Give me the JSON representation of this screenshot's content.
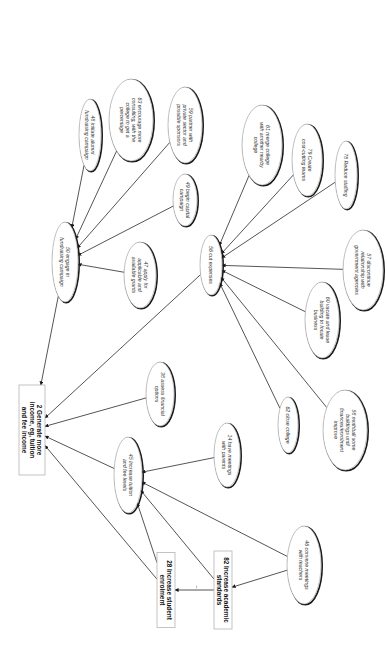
{
  "diagram": {
    "orientation": "rotated-90-clockwise",
    "goal_nodes": [
      {
        "id": "2",
        "lines": [
          "2 Generate more",
          "income, eg, tuition",
          "and fee income"
        ],
        "cx": 32,
        "cy": 430,
        "w": 26,
        "h": 90
      },
      {
        "id": "28",
        "lines": [
          "28 Increase student",
          "enrolment"
        ],
        "cx": 166,
        "cy": 590,
        "w": 18,
        "h": 75
      },
      {
        "id": "82",
        "lines": [
          "82 Increase academic",
          "standards"
        ],
        "cx": 223,
        "cy": 590,
        "w": 18,
        "h": 78
      }
    ],
    "option_nodes": [
      {
        "id": "48",
        "lines": [
          "48 initiate alumni",
          "fundraising campaign"
        ],
        "cx": 90,
        "cy": 135,
        "rx": 11,
        "ry": 36
      },
      {
        "id": "63",
        "lines": [
          "63 encourage more",
          "consulting, with the",
          "college to get a",
          "percentage"
        ],
        "cx": 131,
        "cy": 120,
        "rx": 22,
        "ry": 41
      },
      {
        "id": "59",
        "lines": [
          "59 partner with",
          "private sector and",
          "possible sponsors"
        ],
        "cx": 185,
        "cy": 125,
        "rx": 17,
        "ry": 38
      },
      {
        "id": "49",
        "lines": [
          "49 begin capital",
          "campaign"
        ],
        "cx": 185,
        "cy": 200,
        "rx": 12,
        "ry": 26
      },
      {
        "id": "50",
        "lines": [
          "50 engage in",
          "fundraising campaign"
        ],
        "cx": 65,
        "cy": 262,
        "rx": 13,
        "ry": 40
      },
      {
        "id": "47",
        "lines": [
          "47 apply for",
          "applicable and",
          "available grants"
        ],
        "cx": 140,
        "cy": 275,
        "rx": 16,
        "ry": 33
      },
      {
        "id": "38",
        "lines": [
          "38 assess financial",
          "options"
        ],
        "cx": 160,
        "cy": 394,
        "rx": 14,
        "ry": 32
      },
      {
        "id": "56",
        "lines": [
          "56 cut expenses"
        ],
        "cx": 211,
        "cy": 265,
        "rx": 11,
        "ry": 30
      },
      {
        "id": "61",
        "lines": [
          "61 merge college",
          "with another nearby",
          "college"
        ],
        "cx": 262,
        "cy": 145,
        "rx": 20,
        "ry": 40
      },
      {
        "id": "79",
        "lines": [
          "79 Create",
          "cost-cutting teams"
        ],
        "cx": 307,
        "cy": 160,
        "rx": 15,
        "ry": 36
      },
      {
        "id": "78",
        "lines": [
          "78 Reduce staffing"
        ],
        "cx": 346,
        "cy": 175,
        "rx": 11,
        "ry": 34
      },
      {
        "id": "57",
        "lines": [
          "57 discontinue",
          "relationship with",
          "government agencies"
        ],
        "cx": 363,
        "cy": 270,
        "rx": 20,
        "ry": 40
      },
      {
        "id": "60",
        "lines": [
          "60 vacate and lease",
          "building to locate",
          "business"
        ],
        "cx": 322,
        "cy": 320,
        "rx": 17,
        "ry": 38
      },
      {
        "id": "62",
        "lines": [
          "62 close college"
        ],
        "cx": 288,
        "cy": 425,
        "rx": 10,
        "ry": 28
      },
      {
        "id": "58",
        "lines": [
          "58 mothball some",
          "buildings until",
          "finances/enrolment",
          "improve"
        ],
        "cx": 345,
        "cy": 430,
        "rx": 22,
        "ry": 40
      },
      {
        "id": "45",
        "lines": [
          "45 Increase tuition",
          "and fee levels"
        ],
        "cx": 128,
        "cy": 475,
        "rx": 14,
        "ry": 38
      },
      {
        "id": "14",
        "lines": [
          "14 have meetings",
          "with parents"
        ],
        "cx": 227,
        "cy": 455,
        "rx": 13,
        "ry": 32
      },
      {
        "id": "46",
        "lines": [
          "46 convene meetings",
          "with teachers"
        ],
        "cx": 304,
        "cy": 565,
        "rx": 17,
        "ry": 39
      }
    ],
    "edges": [
      {
        "from": "48",
        "to": "50"
      },
      {
        "from": "63",
        "to": "50"
      },
      {
        "from": "59",
        "to": "50"
      },
      {
        "from": "49",
        "to": "50"
      },
      {
        "from": "47",
        "to": "50"
      },
      {
        "from": "50",
        "to": "2"
      },
      {
        "from": "56",
        "to": "2"
      },
      {
        "from": "38",
        "to": "2"
      },
      {
        "from": "45",
        "to": "2"
      },
      {
        "from": "61",
        "to": "56"
      },
      {
        "from": "79",
        "to": "56"
      },
      {
        "from": "78",
        "to": "56"
      },
      {
        "from": "57",
        "to": "56"
      },
      {
        "from": "60",
        "to": "56"
      },
      {
        "from": "58",
        "to": "56"
      },
      {
        "from": "62",
        "to": "56"
      },
      {
        "from": "14",
        "to": "45"
      },
      {
        "from": "46",
        "to": "45"
      },
      {
        "from": "46",
        "to": "82"
      },
      {
        "from": "28",
        "to": "45"
      },
      {
        "from": "82",
        "to": "45"
      },
      {
        "from": "28",
        "to": "2"
      },
      {
        "from": "82",
        "to": "28",
        "label": "–"
      }
    ]
  }
}
